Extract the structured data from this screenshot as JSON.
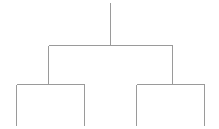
{
  "figure": {
    "name": "dendrogram",
    "width": 219,
    "height": 129,
    "background_color": "#ffffff",
    "line_color": "#9a9a9a",
    "line_width": 1
  },
  "chart_data": {
    "type": "diagram",
    "subtype": "dendrogram",
    "title": "",
    "subtitle": "",
    "xlabel": "",
    "ylabel": "",
    "grid": false,
    "legend": false,
    "axis_visible": false,
    "tick_labels": [],
    "leaf_labels": [],
    "orientation": "top-down",
    "levels": 3,
    "leaf_count": 4,
    "merge_heights": [
      84,
      84,
      45
    ],
    "root": {
      "id": "root",
      "x": 110,
      "merge_y": 45,
      "top_y": 2,
      "children": [
        {
          "id": "cluster-left",
          "x": 48,
          "merge_y": 84,
          "children": [
            {
              "id": "leaf-1",
              "x": 16,
              "bottom_y": 125
            },
            {
              "id": "leaf-2",
              "x": 84,
              "bottom_y": 125
            }
          ]
        },
        {
          "id": "cluster-right",
          "x": 172,
          "merge_y": 84,
          "children": [
            {
              "id": "leaf-3",
              "x": 136,
              "bottom_y": 125
            },
            {
              "id": "leaf-4",
              "x": 204,
              "bottom_y": 125
            }
          ]
        }
      ]
    },
    "segments": [
      {
        "name": "root-stem",
        "x1": 110,
        "y1": 2,
        "x2": 110,
        "y2": 45
      },
      {
        "name": "root-crossbar",
        "x1": 48,
        "y1": 45,
        "x2": 172,
        "y2": 45
      },
      {
        "name": "root-left-descender",
        "x1": 48,
        "y1": 45,
        "x2": 48,
        "y2": 84
      },
      {
        "name": "root-right-descender",
        "x1": 172,
        "y1": 45,
        "x2": 172,
        "y2": 84
      },
      {
        "name": "left-crossbar",
        "x1": 16,
        "y1": 84,
        "x2": 84,
        "y2": 84
      },
      {
        "name": "right-crossbar",
        "x1": 136,
        "y1": 84,
        "x2": 204,
        "y2": 84
      },
      {
        "name": "leaf-1-stem",
        "x1": 16,
        "y1": 84,
        "x2": 16,
        "y2": 125
      },
      {
        "name": "leaf-2-stem",
        "x1": 84,
        "y1": 84,
        "x2": 84,
        "y2": 125
      },
      {
        "name": "leaf-3-stem",
        "x1": 136,
        "y1": 84,
        "x2": 136,
        "y2": 125
      },
      {
        "name": "leaf-4-stem",
        "x1": 204,
        "y1": 84,
        "x2": 204,
        "y2": 125
      }
    ]
  }
}
